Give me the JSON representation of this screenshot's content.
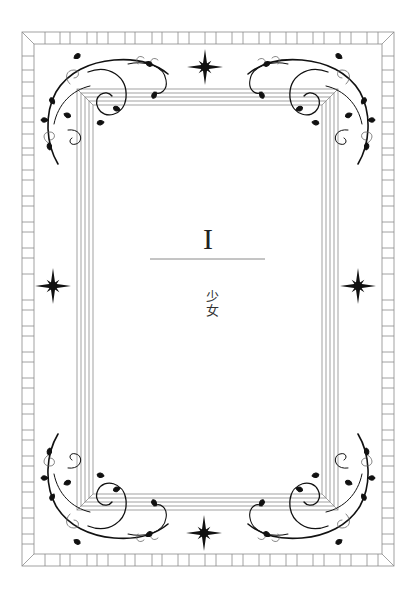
{
  "chapter": {
    "numeral": "I",
    "title": "少女"
  },
  "ornaments": {
    "stars": [
      {
        "position": "top",
        "x": 205,
        "y": 67
      },
      {
        "position": "bottom",
        "x": 204,
        "y": 533
      },
      {
        "position": "left",
        "x": 53,
        "y": 286
      },
      {
        "position": "right",
        "x": 358,
        "y": 286
      }
    ],
    "corner_flourishes": [
      "top-left",
      "top-right",
      "bottom-left",
      "bottom-right"
    ]
  },
  "colors": {
    "frame_line": "#8a8a8a",
    "ornament": "#111111",
    "background": "#ffffff"
  }
}
